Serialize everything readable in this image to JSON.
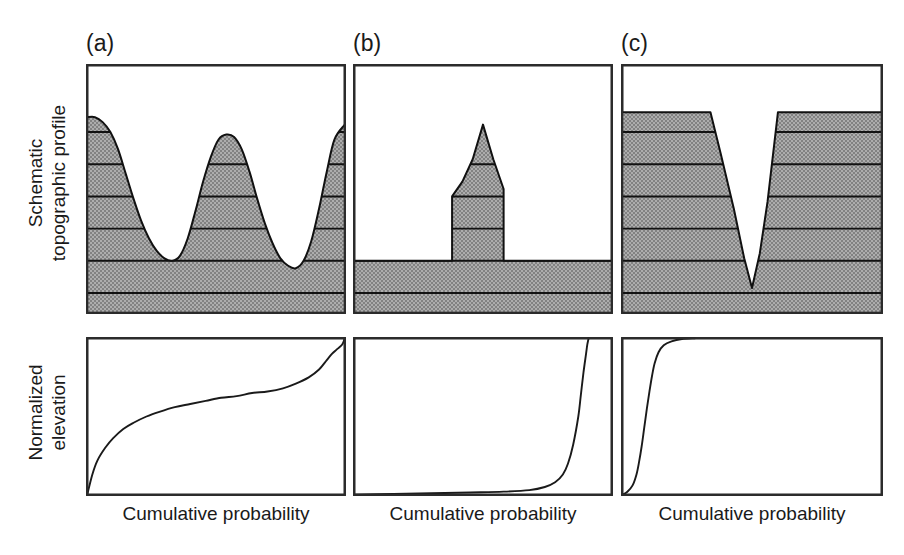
{
  "figure": {
    "title": "",
    "background_color": "#ffffff",
    "terrain_fill_color": "#9a9a9a",
    "line_color": "#111111",
    "width": 904,
    "height": 555
  },
  "row_labels": {
    "top_line1": "Schematic",
    "top_line2": "topographic profile",
    "bottom_line1": "Normalized",
    "bottom_line2": "elevation"
  },
  "panels": [
    {
      "letter": "(a)",
      "xlabel": "Cumulative probability",
      "description": "rolling ridge-and-valley topography"
    },
    {
      "letter": "(b)",
      "xlabel": "Cumulative probability",
      "description": "low plain with a single isolated peak"
    },
    {
      "letter": "(c)",
      "xlabel": "Cumulative probability",
      "description": "high plateau incised by a narrow canyon"
    }
  ],
  "chart_data": [
    {
      "type": "area",
      "panel": "(a)",
      "title": "Schematic topographic profile (a)",
      "xlabel": "",
      "ylabel": "Elevation",
      "xlim": [
        0,
        1
      ],
      "ylim": [
        0,
        1
      ],
      "grid": false,
      "contour_levels": [
        0.08,
        0.21,
        0.34,
        0.47,
        0.6,
        0.73
      ],
      "x": [
        0.0,
        0.03,
        0.06,
        0.09,
        0.12,
        0.15,
        0.18,
        0.21,
        0.24,
        0.27,
        0.3,
        0.33,
        0.36,
        0.39,
        0.42,
        0.45,
        0.48,
        0.51,
        0.54,
        0.57,
        0.6,
        0.63,
        0.66,
        0.69,
        0.72,
        0.75,
        0.78,
        0.81,
        0.84,
        0.87,
        0.9,
        0.93,
        0.96,
        1.0
      ],
      "y": [
        0.79,
        0.79,
        0.77,
        0.73,
        0.66,
        0.56,
        0.46,
        0.37,
        0.3,
        0.25,
        0.22,
        0.21,
        0.23,
        0.3,
        0.41,
        0.53,
        0.63,
        0.7,
        0.72,
        0.71,
        0.66,
        0.57,
        0.46,
        0.36,
        0.28,
        0.22,
        0.19,
        0.18,
        0.21,
        0.29,
        0.42,
        0.57,
        0.7,
        0.76
      ]
    },
    {
      "type": "area",
      "panel": "(b)",
      "title": "Schematic topographic profile (b)",
      "xlabel": "",
      "ylabel": "Elevation",
      "xlim": [
        0,
        1
      ],
      "ylim": [
        0,
        1
      ],
      "grid": false,
      "contour_levels": [
        0.08,
        0.21,
        0.34,
        0.47,
        0.6
      ],
      "x": [
        0.0,
        0.38,
        0.38,
        0.42,
        0.46,
        0.5,
        0.54,
        0.58,
        0.58,
        1.0
      ],
      "y": [
        0.21,
        0.21,
        0.47,
        0.53,
        0.62,
        0.76,
        0.62,
        0.5,
        0.21,
        0.21
      ]
    },
    {
      "type": "area",
      "panel": "(c)",
      "title": "Schematic topographic profile (c)",
      "xlabel": "",
      "ylabel": "Elevation",
      "xlim": [
        0,
        1
      ],
      "ylim": [
        0,
        1
      ],
      "grid": false,
      "contour_levels": [
        0.08,
        0.21,
        0.34,
        0.47,
        0.6,
        0.73
      ],
      "x": [
        0.0,
        0.34,
        0.38,
        0.43,
        0.47,
        0.5,
        0.53,
        0.56,
        0.6,
        1.0
      ],
      "y": [
        0.81,
        0.81,
        0.64,
        0.42,
        0.22,
        0.1,
        0.24,
        0.45,
        0.81,
        0.81
      ]
    },
    {
      "type": "line",
      "panel": "(a)",
      "title": "Hypsometric curve (a)",
      "xlabel": "Cumulative probability",
      "ylabel": "Normalized elevation",
      "xlim": [
        0,
        1
      ],
      "ylim": [
        0,
        1
      ],
      "grid": false,
      "x": [
        0.0,
        0.02,
        0.04,
        0.07,
        0.1,
        0.14,
        0.18,
        0.23,
        0.28,
        0.34,
        0.4,
        0.46,
        0.52,
        0.58,
        0.64,
        0.7,
        0.76,
        0.81,
        0.86,
        0.9,
        0.93,
        0.95,
        0.97,
        0.99,
        1.0
      ],
      "y": [
        0.0,
        0.13,
        0.22,
        0.3,
        0.36,
        0.42,
        0.46,
        0.5,
        0.53,
        0.56,
        0.58,
        0.6,
        0.62,
        0.63,
        0.65,
        0.66,
        0.68,
        0.71,
        0.75,
        0.8,
        0.86,
        0.9,
        0.93,
        0.96,
        1.0
      ]
    },
    {
      "type": "line",
      "panel": "(b)",
      "title": "Hypsometric curve (b)",
      "xlabel": "Cumulative probability",
      "ylabel": "Normalized elevation",
      "xlim": [
        0,
        1
      ],
      "ylim": [
        0,
        1
      ],
      "grid": false,
      "x": [
        0.0,
        0.15,
        0.3,
        0.45,
        0.58,
        0.68,
        0.74,
        0.78,
        0.81,
        0.83,
        0.85,
        0.87,
        0.88,
        0.89,
        0.9,
        0.905,
        0.91
      ],
      "y": [
        0.0,
        0.005,
        0.01,
        0.015,
        0.02,
        0.03,
        0.05,
        0.08,
        0.13,
        0.2,
        0.32,
        0.5,
        0.64,
        0.78,
        0.9,
        0.96,
        1.0
      ]
    },
    {
      "type": "line",
      "panel": "(c)",
      "title": "Hypsometric curve (c)",
      "xlabel": "Cumulative probability",
      "ylabel": "Normalized elevation",
      "xlim": [
        0,
        1
      ],
      "ylim": [
        0,
        1
      ],
      "grid": false,
      "x": [
        0.0,
        0.02,
        0.04,
        0.055,
        0.065,
        0.075,
        0.085,
        0.095,
        0.105,
        0.115,
        0.125,
        0.14,
        0.16,
        0.19,
        0.23,
        0.28
      ],
      "y": [
        0.0,
        0.02,
        0.06,
        0.13,
        0.21,
        0.31,
        0.43,
        0.55,
        0.66,
        0.76,
        0.84,
        0.91,
        0.955,
        0.98,
        0.995,
        1.0
      ]
    }
  ]
}
